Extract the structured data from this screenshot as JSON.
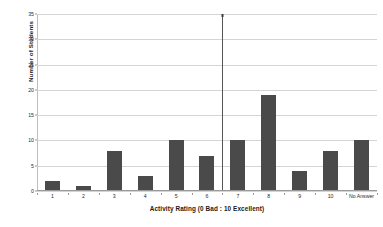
{
  "chart_data": {
    "type": "bar",
    "title": "",
    "subtitle": "",
    "xlabel": "Activity Rating (0 Bad : 10 Excellent)",
    "ylabel": "Number of Students",
    "categories": [
      "1",
      "2",
      "3",
      "4",
      "5",
      "6",
      "7",
      "8",
      "9",
      "10",
      "No Answer"
    ],
    "values": [
      2,
      1,
      8,
      3,
      10,
      7,
      10,
      19,
      4,
      8,
      10
    ],
    "ylim": [
      0,
      35
    ],
    "yticks": [
      0,
      5,
      10,
      15,
      20,
      25,
      30,
      35
    ],
    "ytick_labels": [
      "0",
      "5",
      "10",
      "15",
      "20",
      "25",
      "30",
      "35"
    ],
    "grid": true,
    "legend": false,
    "legend_position": "none",
    "bar_color": "#4a4a4a",
    "gridline_color": "#d4d4d4",
    "axis_color": "#9a9a9a",
    "background_color": "#ffffff",
    "text_color": "#1a1a1a",
    "annotations": [
      {
        "name": "median-marker-line",
        "type": "vertical-line",
        "x_position_between_categories": "6 and 7",
        "color": "#555555",
        "label": ""
      }
    ]
  }
}
